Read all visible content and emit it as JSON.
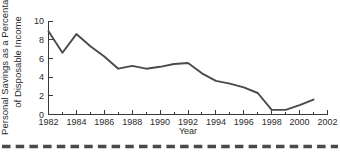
{
  "figure": {
    "ylabel_line1": "Personal Savings as a Percentage",
    "ylabel_line2": "of Disposable Income",
    "xlabel": "Year",
    "decorative_rule": "dashed-horizontal-rule"
  },
  "chart_data": {
    "type": "line",
    "title": "",
    "xlabel": "Year",
    "ylabel": "Personal Savings as a Percentage of Disposable Income",
    "xlim": [
      1982,
      2002
    ],
    "ylim": [
      0,
      10
    ],
    "grid": false,
    "legend": "none",
    "xtick_labels": [
      "1982",
      "1984",
      "1986",
      "1988",
      "1990",
      "1992",
      "1994",
      "1996",
      "1998",
      "2000",
      "2002"
    ],
    "xtick_values": [
      1982,
      1984,
      1986,
      1988,
      1990,
      1992,
      1994,
      1996,
      1998,
      2000,
      2002
    ],
    "xminor_values": [
      1983,
      1985,
      1987,
      1989,
      1991,
      1993,
      1995,
      1997,
      1999,
      2001
    ],
    "ytick_labels": [
      "0",
      "2",
      "4",
      "6",
      "8",
      "10"
    ],
    "ytick_values": [
      0,
      2,
      4,
      6,
      8,
      10
    ],
    "x": [
      1982,
      1983,
      1984,
      1985,
      1986,
      1987,
      1988,
      1989,
      1990,
      1991,
      1992,
      1993,
      1994,
      1995,
      1996,
      1997,
      1998,
      1999,
      2000,
      2001
    ],
    "values": [
      8.9,
      6.6,
      8.6,
      7.3,
      6.2,
      4.9,
      5.2,
      4.9,
      5.1,
      5.4,
      5.5,
      4.4,
      3.6,
      3.3,
      2.9,
      2.3,
      0.5,
      0.5,
      1.0,
      1.6
    ],
    "series": [
      {
        "name": "Personal savings rate",
        "color": "#4a4a4a",
        "values": [
          8.9,
          6.6,
          8.6,
          7.3,
          6.2,
          4.9,
          5.2,
          4.9,
          5.1,
          5.4,
          5.5,
          4.4,
          3.6,
          3.3,
          2.9,
          2.3,
          0.5,
          0.5,
          1.0,
          1.6
        ]
      }
    ]
  }
}
